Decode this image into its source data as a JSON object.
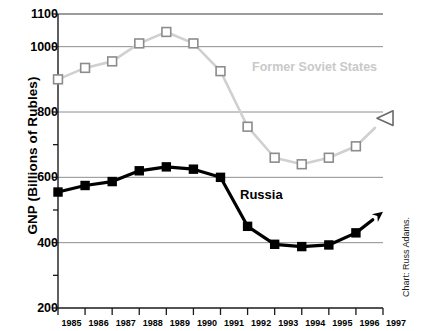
{
  "chart_data": {
    "type": "line",
    "title": "",
    "xlabel": "",
    "ylabel": "GNP (Billions of Rubles)",
    "x": [
      1985,
      1986,
      1987,
      1988,
      1989,
      1990,
      1991,
      1992,
      1993,
      1994,
      1995,
      1996,
      1997
    ],
    "xtick_labels": [
      "1985",
      "1986",
      "1987",
      "1988",
      "1989",
      "1990",
      "1991",
      "1992",
      "1993",
      "1994",
      "1995",
      "1996",
      "1997"
    ],
    "ytick_labels": [
      "1100",
      "1000",
      "800",
      "600",
      "400",
      "200"
    ],
    "ytick_values": [
      1100,
      1000,
      800,
      600,
      400,
      200
    ],
    "minor_tick_values": [
      900,
      700,
      500,
      300
    ],
    "gridline_values": [
      1100,
      1000,
      800,
      600,
      400
    ],
    "ylim": [
      200,
      1100
    ],
    "xlim": [
      1985,
      1997
    ],
    "grid": true,
    "legend_position": "inline-annotation",
    "series": [
      {
        "name": "Former Soviet States",
        "color": "#d0d0d0",
        "marker": "open-square",
        "marker_color": "#ffffff",
        "marker_edge": "#8c8c8c",
        "label_color": "#c9c9c9",
        "end_arrow": "open-triangle-left",
        "values": [
          900,
          935,
          955,
          1010,
          1045,
          1010,
          925,
          755,
          660,
          640,
          660,
          695,
          775
        ],
        "marker_years": [
          1985,
          1986,
          1987,
          1988,
          1989,
          1990,
          1991,
          1992,
          1993,
          1994,
          1995,
          1996
        ]
      },
      {
        "name": "Russia",
        "color": "#000000",
        "marker": "filled-square",
        "marker_color": "#000000",
        "marker_edge": "#000000",
        "label_color": "#000000",
        "end_arrow": "filled-arrow-up-right",
        "values": [
          555,
          575,
          587,
          620,
          632,
          625,
          600,
          450,
          395,
          388,
          393,
          430,
          495
        ],
        "marker_years": [
          1985,
          1986,
          1987,
          1988,
          1989,
          1990,
          1991,
          1992,
          1993,
          1994,
          1995,
          1996
        ]
      }
    ],
    "annotations": [
      {
        "text": "Former Soviet States",
        "series": "Former Soviet States"
      },
      {
        "text": "Russia",
        "series": "Russia"
      }
    ],
    "credit": "Chart: Russ Adams."
  }
}
